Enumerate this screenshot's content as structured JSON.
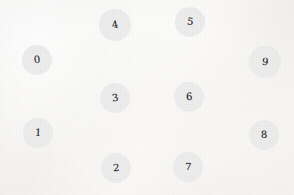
{
  "diagram": {
    "background_color": "#f8f7f5",
    "node_fill_color": "#ececec",
    "label_color": "#2b2b2b",
    "node_count": 10,
    "nodes": [
      {
        "label": "0",
        "cx": 37,
        "cy": 60,
        "r": 15,
        "tilt": -6
      },
      {
        "label": "1",
        "cx": 38,
        "cy": 133,
        "r": 15,
        "tilt": 4
      },
      {
        "label": "2",
        "cx": 116,
        "cy": 168,
        "r": 15,
        "tilt": -3
      },
      {
        "label": "3",
        "cx": 115,
        "cy": 98,
        "r": 15,
        "tilt": -8
      },
      {
        "label": "4",
        "cx": 115,
        "cy": 25,
        "r": 16,
        "tilt": -10
      },
      {
        "label": "5",
        "cx": 190,
        "cy": 22,
        "r": 15,
        "tilt": 7
      },
      {
        "label": "6",
        "cx": 189,
        "cy": 97,
        "r": 15,
        "tilt": -4
      },
      {
        "label": "7",
        "cx": 188,
        "cy": 167,
        "r": 15,
        "tilt": 2
      },
      {
        "label": "8",
        "cx": 264,
        "cy": 135,
        "r": 15,
        "tilt": -2
      },
      {
        "label": "9",
        "cx": 265,
        "cy": 62,
        "r": 16,
        "tilt": 5
      }
    ]
  }
}
